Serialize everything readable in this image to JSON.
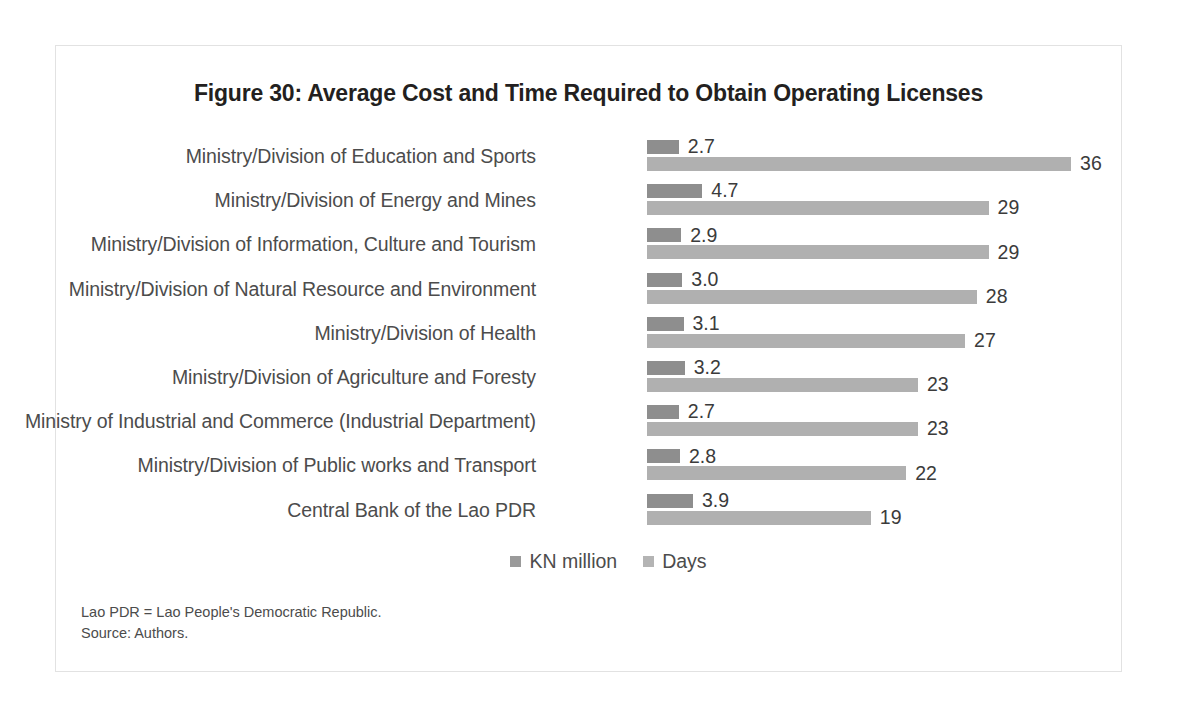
{
  "figure": {
    "title": "Figure 30: Average Cost and Time Required to Obtain Operating Licenses",
    "notes": [
      "Lao PDR = Lao People's Democratic Republic.",
      "Source: Authors."
    ]
  },
  "colors": {
    "cost_bar": "#8e8e8e",
    "days_bar": "#b0b0b0",
    "text": "#4c4c4c",
    "title": "#231f20",
    "frame_border": "#e2e2e2"
  },
  "chart_data": {
    "type": "bar",
    "orientation": "horizontal",
    "title": "Figure 30: Average Cost and Time Required to Obtain Operating Licenses",
    "xlabel": "",
    "ylabel": "",
    "grid": false,
    "legend_position": "bottom",
    "axis_hidden": true,
    "xlim": [
      0,
      38
    ],
    "categories": [
      "Ministry/Division of Education and Sports",
      "Ministry/Division of Energy and Mines",
      "Ministry/Division of Information, Culture and Tourism",
      "Ministry/Division of Natural Resource and Environment",
      "Ministry/Division of Health",
      "Ministry/Division of Agriculture and Foresty",
      "Ministry of Industrial and Commerce (Industrial Department)",
      "Ministry/Division of Public works and Transport",
      "Central Bank of the Lao PDR"
    ],
    "series": [
      {
        "name": "KN million",
        "color": "#8e8e8e",
        "values": [
          2.7,
          4.7,
          2.9,
          3.0,
          3.1,
          3.2,
          2.7,
          2.8,
          3.9
        ],
        "labels": [
          "2.7",
          "4.7",
          "2.9",
          "3.0",
          "3.1",
          "3.2",
          "2.7",
          "2.8",
          "3.9"
        ]
      },
      {
        "name": "Days",
        "color": "#b0b0b0",
        "values": [
          36,
          29,
          29,
          28,
          27,
          23,
          23,
          22,
          19
        ],
        "labels": [
          "36",
          "29",
          "29",
          "28",
          "27",
          "23",
          "23",
          "22",
          "19"
        ]
      }
    ]
  }
}
